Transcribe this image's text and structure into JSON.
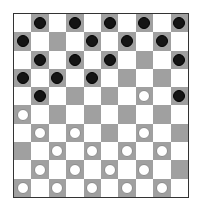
{
  "game": {
    "type": "draughts",
    "board_size": 10,
    "colors": {
      "light": "#ffffff",
      "dark": "#a0a0a0",
      "black_piece": "#141414",
      "white_piece": "#ffffff"
    },
    "rows": [
      [
        "L",
        "B",
        "L",
        "B",
        "L",
        "B",
        "L",
        "B",
        "L",
        "B"
      ],
      [
        "B",
        "L",
        "D",
        "L",
        "B",
        "L",
        "B",
        "L",
        "B",
        "L"
      ],
      [
        "L",
        "B",
        "L",
        "B",
        "L",
        "B",
        "L",
        "D",
        "L",
        "B"
      ],
      [
        "B",
        "L",
        "B",
        "L",
        "B",
        "L",
        "D",
        "L",
        "D",
        "L"
      ],
      [
        "L",
        "B",
        "L",
        "D",
        "L",
        "D",
        "L",
        "W",
        "L",
        "B"
      ],
      [
        "W",
        "L",
        "D",
        "L",
        "D",
        "L",
        "D",
        "L",
        "D",
        "L"
      ],
      [
        "L",
        "W",
        "L",
        "W",
        "L",
        "D",
        "L",
        "W",
        "L",
        "D"
      ],
      [
        "D",
        "L",
        "W",
        "L",
        "W",
        "L",
        "W",
        "L",
        "W",
        "L"
      ],
      [
        "L",
        "W",
        "L",
        "W",
        "L",
        "W",
        "L",
        "W",
        "L",
        "D"
      ],
      [
        "W",
        "L",
        "W",
        "L",
        "W",
        "L",
        "W",
        "L",
        "W",
        "L"
      ]
    ],
    "piece_counts": {
      "black": 18,
      "white": 18
    }
  }
}
